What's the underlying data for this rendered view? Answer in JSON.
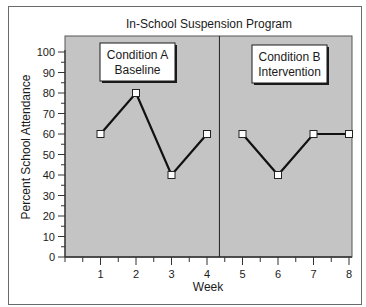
{
  "chart_data": {
    "type": "line",
    "title": "In-School Suspension Program",
    "xlabel": "Week",
    "ylabel": "Percent School Attendance",
    "ylim": [
      0,
      100
    ],
    "xlim": [
      0,
      8.35
    ],
    "y_ticks": [
      0,
      10,
      20,
      30,
      40,
      50,
      60,
      70,
      80,
      90,
      100
    ],
    "x_ticks": [
      1,
      2,
      3,
      4,
      5,
      6,
      7,
      8
    ],
    "grid": false,
    "phase_divider_x": 4.35,
    "phases": [
      {
        "name": "Condition A",
        "subtitle": "Baseline"
      },
      {
        "name": "Condition B",
        "subtitle": "Intervention"
      }
    ],
    "series": [
      {
        "name": "Condition A Baseline",
        "x": [
          1,
          2,
          3,
          4
        ],
        "values": [
          60,
          80,
          40,
          60
        ]
      },
      {
        "name": "Condition B Intervention",
        "x": [
          5,
          6,
          7,
          8
        ],
        "values": [
          60,
          40,
          60,
          60
        ]
      }
    ],
    "colors": {
      "plot_background": "#c4c4c4",
      "line": "#111111",
      "marker_fill": "#ffffff"
    }
  }
}
